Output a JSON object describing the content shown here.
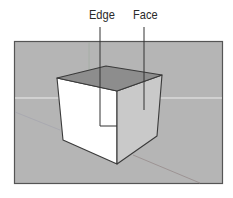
{
  "figure": {
    "callouts": [
      {
        "id": "edge",
        "label": "Edge"
      },
      {
        "id": "face",
        "label": "Face"
      }
    ]
  },
  "colors": {
    "viewport_background": "#b5b5b5",
    "viewport_border": "#555555",
    "horizon_line": "#ececec",
    "cube_top_face": "#8d8d8d",
    "cube_left_face": "#ffffff",
    "cube_right_face": "#c9c9c9",
    "cube_edge": "#3a3a3a",
    "callout_line": "#333333",
    "axis_green": "#9fb09f",
    "axis_red": "#a89898",
    "axis_blue": "#9c9cab"
  }
}
